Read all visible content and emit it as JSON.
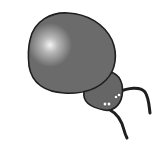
{
  "image": {
    "subject": "cartoon beetle",
    "description": "Grey cartoon bug with large rounded body, small head, two curved antennae and white eye dots",
    "colors": {
      "background": "#ffffff",
      "body_fill": "#6b6b6b",
      "outline": "#1e1e1e",
      "highlight": "#f2f2f2",
      "eyes": "#ffffff"
    }
  }
}
